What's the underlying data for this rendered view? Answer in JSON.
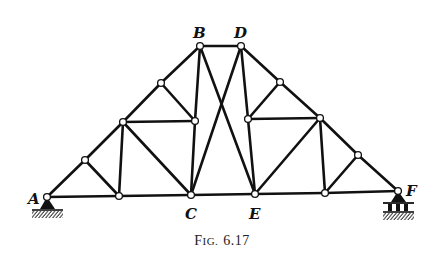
{
  "figure": {
    "caption_prefix": "F",
    "caption_smallcaps": "IG.",
    "caption_number": "6.17"
  },
  "labels": {
    "A": "A",
    "B": "B",
    "C": "C",
    "D": "D",
    "E": "E",
    "F": "F"
  },
  "colors": {
    "ink": "#111111",
    "background": "#ffffff"
  },
  "truss": {
    "joints": {
      "A": [
        47,
        197
      ],
      "L1": [
        85,
        160
      ],
      "L2": [
        123,
        122
      ],
      "L3": [
        161,
        83
      ],
      "B": [
        200,
        46
      ],
      "D": [
        241,
        46
      ],
      "R3": [
        280,
        82
      ],
      "R2": [
        320,
        118
      ],
      "R1": [
        358,
        155
      ],
      "F": [
        398,
        191
      ],
      "BL1": [
        119,
        196
      ],
      "C": [
        191,
        195
      ],
      "E": [
        255,
        194
      ],
      "BR1": [
        325,
        193
      ],
      "IL": [
        195,
        121
      ],
      "IR": [
        248,
        119
      ]
    },
    "members": [
      [
        "A",
        "L1"
      ],
      [
        "L1",
        "L2"
      ],
      [
        "L2",
        "L3"
      ],
      [
        "L3",
        "B"
      ],
      [
        "B",
        "D"
      ],
      [
        "D",
        "R3"
      ],
      [
        "R3",
        "R2"
      ],
      [
        "R2",
        "R1"
      ],
      [
        "R1",
        "F"
      ],
      [
        "A",
        "BL1"
      ],
      [
        "BL1",
        "C"
      ],
      [
        "C",
        "E"
      ],
      [
        "E",
        "BR1"
      ],
      [
        "BR1",
        "F"
      ],
      [
        "L1",
        "BL1"
      ],
      [
        "L2",
        "BL1"
      ],
      [
        "L2",
        "C"
      ],
      [
        "L2",
        "IL"
      ],
      [
        "L3",
        "IL"
      ],
      [
        "B",
        "IL"
      ],
      [
        "IL",
        "C"
      ],
      [
        "B",
        "E"
      ],
      [
        "D",
        "C"
      ],
      [
        "D",
        "IR"
      ],
      [
        "IR",
        "E"
      ],
      [
        "R3",
        "IR"
      ],
      [
        "IR",
        "R2"
      ],
      [
        "R2",
        "E"
      ],
      [
        "R2",
        "BR1"
      ],
      [
        "R1",
        "BR1"
      ]
    ],
    "supports": [
      {
        "joint": "A",
        "type": "pin"
      },
      {
        "joint": "F",
        "type": "roller"
      }
    ]
  }
}
